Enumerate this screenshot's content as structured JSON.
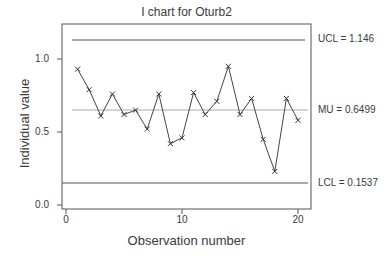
{
  "chart_data": {
    "type": "line",
    "title": "I chart for Oturb2",
    "xlabel": "Observation number",
    "ylabel": "Individual value",
    "x": [
      1,
      2,
      3,
      4,
      5,
      6,
      7,
      8,
      9,
      10,
      11,
      12,
      13,
      14,
      15,
      16,
      17,
      18,
      19,
      20
    ],
    "series": [
      {
        "name": "Individual value",
        "marker": "x",
        "values": [
          0.93,
          0.79,
          0.61,
          0.76,
          0.62,
          0.65,
          0.52,
          0.76,
          0.42,
          0.46,
          0.77,
          0.62,
          0.71,
          0.95,
          0.62,
          0.73,
          0.45,
          0.23,
          0.73,
          0.58
        ]
      }
    ],
    "reference_lines": [
      {
        "name": "UCL",
        "label": "UCL = 1.146",
        "value": 1.146
      },
      {
        "name": "MU",
        "label": "MU = 0.6499",
        "value": 0.6499
      },
      {
        "name": "LCL",
        "label": "LCL = 0.1537",
        "value": 0.1537
      }
    ],
    "xlim": [
      0,
      21
    ],
    "ylim": [
      0,
      1.25
    ],
    "xticks": [
      "0",
      "10",
      "20"
    ],
    "yticks": [
      "0.0",
      "0.5",
      "1.0"
    ],
    "grid": false,
    "legend": "none"
  },
  "labels": {
    "title": "I chart for Oturb2",
    "xlabel": "Observation number",
    "ylabel": "Individual value",
    "ucl": "UCL = 1.146",
    "mu": "MU = 0.6499",
    "lcl": "LCL = 0.1537",
    "yticks": [
      "0.0",
      "0.5",
      "1.0"
    ],
    "xticks": [
      "0",
      "10",
      "20"
    ]
  },
  "colors": {
    "line": "#444444",
    "center_line": "#aaaaaa",
    "limit_line": "#555555",
    "text": "#3a3a3a"
  }
}
